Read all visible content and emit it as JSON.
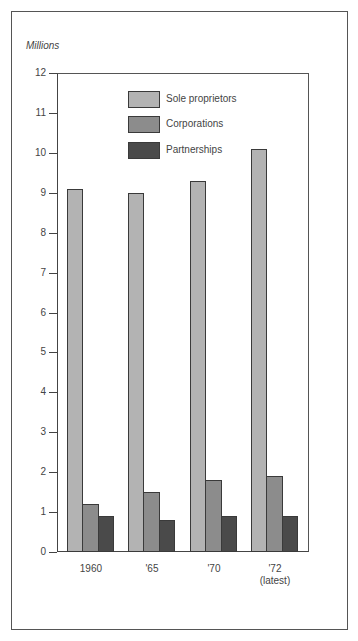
{
  "chart_data": {
    "type": "bar",
    "title": "",
    "ylabel": "Millions",
    "xlabel": "",
    "ylim": [
      0,
      12
    ],
    "yticks": [
      0,
      1,
      2,
      3,
      4,
      5,
      6,
      7,
      8,
      9,
      10,
      11,
      12
    ],
    "categories": [
      "1960",
      "'65",
      "'70",
      "'72 (latest)"
    ],
    "category_labels": [
      [
        "1960"
      ],
      [
        "'65"
      ],
      [
        "'70"
      ],
      [
        "'72",
        "(latest)"
      ]
    ],
    "series": [
      {
        "name": "Sole proprietors",
        "color": "#b3b3b3",
        "values": [
          9.1,
          9.0,
          9.3,
          10.1
        ]
      },
      {
        "name": "Corporations",
        "color": "#8c8c8c",
        "values": [
          1.2,
          1.5,
          1.8,
          1.9
        ]
      },
      {
        "name": "Partnerships",
        "color": "#4a4a4a",
        "values": [
          0.9,
          0.8,
          0.9,
          0.9
        ]
      }
    ],
    "legend_position": "top-center-inside",
    "grid": false
  }
}
